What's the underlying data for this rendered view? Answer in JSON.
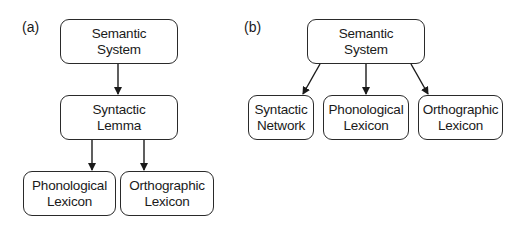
{
  "diagram": {
    "panels": [
      {
        "label": "(a)",
        "nodes": [
          {
            "id": "a-semantic",
            "line1": "Semantic",
            "line2": "System"
          },
          {
            "id": "a-syntactic",
            "line1": "Syntactic",
            "line2": "Lemma"
          },
          {
            "id": "a-phonological",
            "line1": "Phonological",
            "line2": "Lexicon"
          },
          {
            "id": "a-orthographic",
            "line1": "Orthographic",
            "line2": "Lexicon"
          }
        ],
        "edges": [
          {
            "from": "a-semantic",
            "to": "a-syntactic"
          },
          {
            "from": "a-syntactic",
            "to": "a-phonological"
          },
          {
            "from": "a-syntactic",
            "to": "a-orthographic"
          }
        ]
      },
      {
        "label": "(b)",
        "nodes": [
          {
            "id": "b-semantic",
            "line1": "Semantic",
            "line2": "System"
          },
          {
            "id": "b-syntactic",
            "line1": "Syntactic",
            "line2": "Network"
          },
          {
            "id": "b-phonological",
            "line1": "Phonological",
            "line2": "Lexicon"
          },
          {
            "id": "b-orthographic",
            "line1": "Orthographic",
            "line2": "Lexicon"
          }
        ],
        "edges": [
          {
            "from": "b-semantic",
            "to": "b-syntactic"
          },
          {
            "from": "b-semantic",
            "to": "b-phonological"
          },
          {
            "from": "b-semantic",
            "to": "b-orthographic"
          }
        ]
      }
    ]
  }
}
